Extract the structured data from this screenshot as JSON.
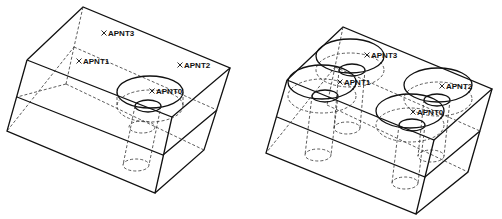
{
  "figures": [
    {
      "id": "single",
      "points": [
        {
          "label": "APNT3",
          "x": 104,
          "y": 33
        },
        {
          "label": "APNT1",
          "x": 79,
          "y": 61
        },
        {
          "label": "APNT2",
          "x": 180,
          "y": 65
        },
        {
          "label": "APNT0",
          "x": 152,
          "y": 91
        }
      ]
    },
    {
      "id": "quad",
      "points": [
        {
          "label": "APNT3",
          "x": 367,
          "y": 55
        },
        {
          "label": "APNT1",
          "x": 340,
          "y": 82
        },
        {
          "label": "APNT2",
          "x": 442,
          "y": 86
        },
        {
          "label": "APNT0",
          "x": 413,
          "y": 112
        }
      ]
    }
  ],
  "colors": {
    "line": "#1a1a1a",
    "background": "#ffffff"
  }
}
